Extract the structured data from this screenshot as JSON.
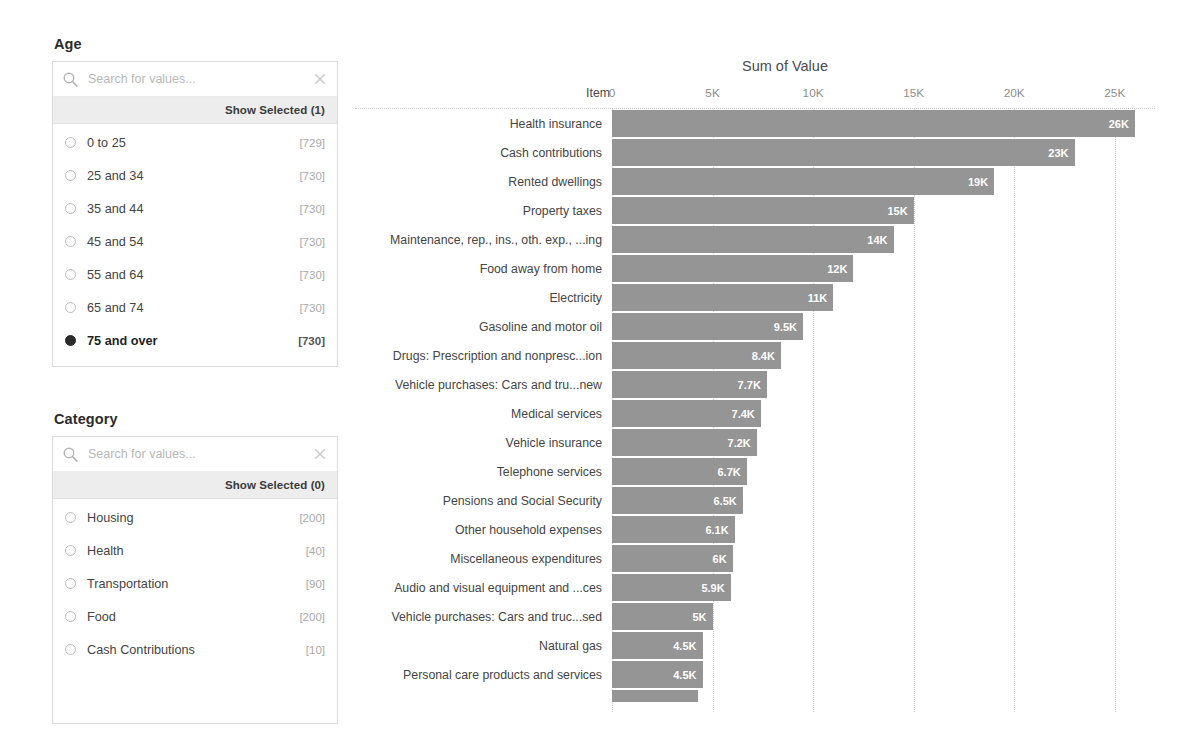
{
  "filters": [
    {
      "id": "age",
      "title": "Age",
      "search_placeholder": "Search for values...",
      "search_value": "",
      "search_icon": "search-icon",
      "clear_icon": "close-icon",
      "show_selected_label": "Show Selected (1)",
      "options": [
        {
          "label": "0 to 25",
          "count": "[729]",
          "selected": false
        },
        {
          "label": "25 and 34",
          "count": "[730]",
          "selected": false
        },
        {
          "label": "35 and 44",
          "count": "[730]",
          "selected": false
        },
        {
          "label": "45 and 54",
          "count": "[730]",
          "selected": false
        },
        {
          "label": "55 and 64",
          "count": "[730]",
          "selected": false
        },
        {
          "label": "65 and 74",
          "count": "[730]",
          "selected": false
        },
        {
          "label": "75 and over",
          "count": "[730]",
          "selected": true
        }
      ]
    },
    {
      "id": "category",
      "title": "Category",
      "search_placeholder": "Search for values...",
      "search_value": "",
      "search_icon": "search-icon",
      "clear_icon": "close-icon",
      "show_selected_label": "Show Selected (0)",
      "options": [
        {
          "label": "Housing",
          "count": "[200]",
          "selected": false
        },
        {
          "label": "Health",
          "count": "[40]",
          "selected": false
        },
        {
          "label": "Transportation",
          "count": "[90]",
          "selected": false
        },
        {
          "label": "Food",
          "count": "[200]",
          "selected": false
        },
        {
          "label": "Cash Contributions",
          "count": "[10]",
          "selected": false
        }
      ]
    }
  ],
  "chart_data": {
    "type": "bar",
    "orientation": "horizontal",
    "title": "Sum of Value",
    "xlabel": "",
    "ylabel": "Item",
    "category_header": "Item",
    "xlim": [
      0,
      27000
    ],
    "grid": true,
    "tick_labels": [
      "0",
      "5K",
      "10K",
      "15K",
      "20K",
      "25K"
    ],
    "tick_values": [
      0,
      5000,
      10000,
      15000,
      20000,
      25000
    ],
    "bar_color": "#959595",
    "categories": [
      "Health insurance",
      "Cash contributions",
      "Rented dwellings",
      "Property taxes",
      "Maintenance, rep., ins., oth. exp., ...ing",
      "Food away from home",
      "Electricity",
      "Gasoline and motor oil",
      "Drugs: Prescription and nonpresc...ion",
      "Vehicle purchases: Cars and tru...new",
      "Medical services",
      "Vehicle insurance",
      "Telephone services",
      "Pensions and Social Security",
      "Other household expenses",
      "Miscellaneous expenditures",
      "Audio and visual equipment and ...ces",
      "Vehicle purchases: Cars and truc...sed",
      "Natural gas",
      "Personal care products and services"
    ],
    "values": [
      26000,
      23000,
      19000,
      15000,
      14000,
      12000,
      11000,
      9500,
      8400,
      7700,
      7400,
      7200,
      6700,
      6500,
      6100,
      6000,
      5900,
      5000,
      4500,
      4500
    ],
    "value_labels": [
      "26K",
      "23K",
      "19K",
      "15K",
      "14K",
      "12K",
      "11K",
      "9.5K",
      "8.4K",
      "7.7K",
      "7.4K",
      "7.2K",
      "6.7K",
      "6.5K",
      "6.1K",
      "6K",
      "5.9K",
      "5K",
      "4.5K",
      "4.5K"
    ],
    "clipped_row": {
      "value": 4300,
      "label": ""
    }
  }
}
